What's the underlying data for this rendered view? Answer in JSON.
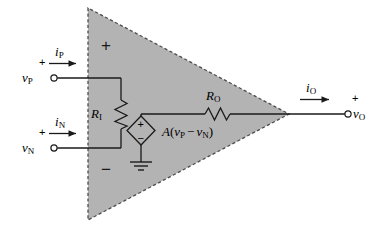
{
  "figure": {
    "type": "circuit-diagram",
    "colors": {
      "triangle_fill": "#b3b3b3",
      "triangle_edge": "#4d4d4d",
      "wire": "#1a1a1a",
      "background": "#ffffff"
    }
  },
  "inputs": {
    "noninverting": {
      "voltage_label": "v",
      "voltage_subscript": "P",
      "polarity_sign": "+",
      "current_label": "i",
      "current_subscript": "P",
      "terminal": "open-circle"
    },
    "inverting": {
      "voltage_label": "v",
      "voltage_subscript": "N",
      "polarity_sign": "+",
      "current_label": "i",
      "current_subscript": "N",
      "terminal": "open-circle"
    }
  },
  "output": {
    "voltage_label": "v",
    "voltage_subscript": "O",
    "polarity_sign": "+",
    "current_label": "i",
    "current_subscript": "O",
    "terminal": "open-circle"
  },
  "amplifier_body": {
    "plus_sign": "+",
    "minus_sign": "−",
    "shape": "triangle",
    "edge_style": "dashed"
  },
  "components": {
    "input_resistor": {
      "label": "R",
      "subscript": "I",
      "symbol": "zigzag-resistor",
      "orientation": "vertical"
    },
    "output_resistor": {
      "label": "R",
      "subscript": "O",
      "symbol": "zigzag-resistor",
      "orientation": "horizontal"
    },
    "dependent_source": {
      "symbol": "diamond-vcvs",
      "plus_sign": "+",
      "minus_sign": "−",
      "expression_gain": "A",
      "expression_open": "(",
      "expression_v1": "v",
      "expression_v1_sub": "P",
      "expression_minus": "−",
      "expression_v2": "v",
      "expression_v2_sub": "N",
      "expression_close": ")",
      "ground": "earth-ground"
    }
  }
}
